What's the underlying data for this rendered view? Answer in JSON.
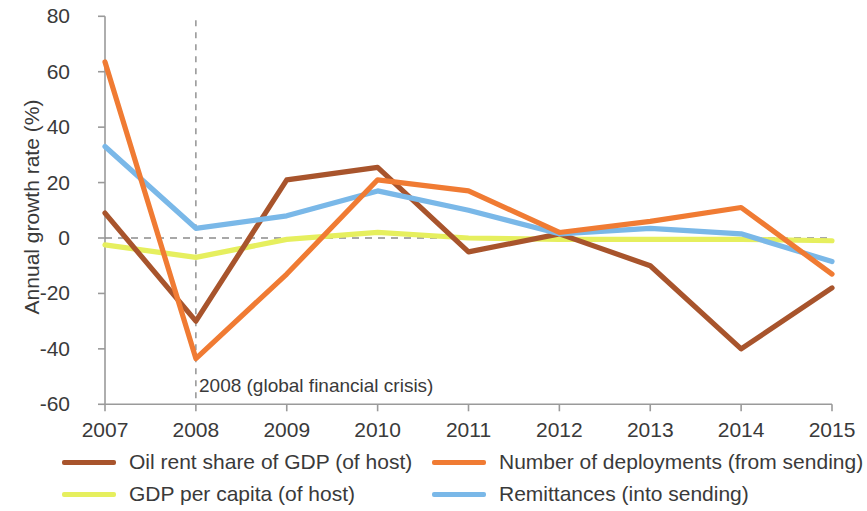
{
  "chart_data": {
    "type": "line",
    "title": "",
    "xlabel": "",
    "ylabel": "Annual growth rate (%)",
    "x": [
      2007,
      2008,
      2009,
      2010,
      2011,
      2012,
      2013,
      2014,
      2015
    ],
    "categories": [
      "2007",
      "2008",
      "2009",
      "2010",
      "2011",
      "2012",
      "2013",
      "2014",
      "2015"
    ],
    "xlim": [
      2007,
      2015
    ],
    "ylim": [
      -60,
      80
    ],
    "yticks": [
      -60,
      -40,
      -20,
      0,
      20,
      40,
      60,
      80
    ],
    "ytick_labels": [
      "-60",
      "-40",
      "-20",
      "0",
      "20",
      "40",
      "60",
      "80"
    ],
    "grid": false,
    "zero_line": true,
    "legend_position": "bottom",
    "annotations": [
      {
        "text": "2008 (global financial crisis)",
        "x": 2008,
        "type": "vertical-dashed-line-with-label"
      }
    ],
    "series": [
      {
        "name": "Oil rent share of GDP (of host)",
        "color": "#a8542c",
        "values": [
          9,
          -30,
          21,
          25.5,
          -5,
          1.5,
          -10,
          -40,
          -18
        ]
      },
      {
        "name": "Number of deployments (from sending)",
        "color": "#f07b33",
        "values": [
          63.5,
          -43.5,
          -13,
          21,
          17,
          2,
          6,
          11,
          -13
        ]
      },
      {
        "name": "GDP per capita (of host)",
        "color": "#e6ef5e",
        "values": [
          -2.5,
          -7,
          -0.5,
          2,
          0,
          -0.5,
          -0.5,
          -0.5,
          -1
        ]
      },
      {
        "name": "Remittances (into sending)",
        "color": "#7ab8e8",
        "values": [
          33,
          3.5,
          8,
          17,
          10,
          1.5,
          3.5,
          1.5,
          -8.5
        ]
      }
    ]
  },
  "axis": {
    "y_title": "Annual growth rate (%)"
  },
  "legend": {
    "items": [
      {
        "label": "Oil rent share of GDP (of host)",
        "color": "#a8542c"
      },
      {
        "label": "GDP per capita (of host)",
        "color": "#e6ef5e"
      },
      {
        "label": "Number of deployments (from sending)",
        "color": "#f07b33"
      },
      {
        "label": "Remittances (into sending)",
        "color": "#7ab8e8"
      }
    ]
  },
  "annotation": {
    "crisis_label": "2008 (global financial crisis)"
  }
}
